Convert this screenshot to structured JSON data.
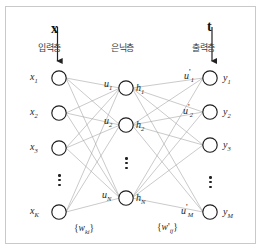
{
  "diagram": {
    "background_color": "#ffffff",
    "border_color": "#c9c9c9",
    "node_stroke_color": "#1e1e1e",
    "edge_color": "#9a9a9a",
    "arrow_color": "#222222"
  },
  "vectors": {
    "input_vector": "x",
    "target_vector": "t"
  },
  "layers": {
    "input_name": "입력층",
    "hidden_name": "은닉층",
    "output_name": "출력층"
  },
  "input_nodes": [
    {
      "label": "x",
      "sub": "1"
    },
    {
      "label": "x",
      "sub": "2"
    },
    {
      "label": "x",
      "sub": "3"
    },
    {
      "label": "x",
      "sub": "K"
    }
  ],
  "hidden_nodes": [
    {
      "pre_label": "u",
      "pre_sub": "1",
      "act_label": "h",
      "act_sub": "1"
    },
    {
      "pre_label": "u",
      "pre_sub": "2",
      "act_label": "h",
      "act_sub": "2"
    },
    {
      "pre_label": "u",
      "pre_sub": "N",
      "act_label": "h",
      "act_sub": "N"
    }
  ],
  "output_nodes": [
    {
      "pre_label": "u",
      "pre_prime": "'",
      "pre_sub": "1",
      "out_label": "y",
      "out_sub": "1"
    },
    {
      "pre_label": "u",
      "pre_prime": "'",
      "pre_sub": "2",
      "out_label": "y",
      "out_sub": "2"
    },
    {
      "pre_label": "",
      "pre_prime": "",
      "pre_sub": "",
      "out_label": "y",
      "out_sub": "3"
    },
    {
      "pre_label": "u",
      "pre_prime": "'",
      "pre_sub": "M",
      "out_label": "y",
      "out_sub": "M"
    }
  ],
  "weights": {
    "input_to_hidden": {
      "open": "{",
      "symbol": "w",
      "prime": "",
      "sub": "ki",
      "close": "}"
    },
    "hidden_to_output": {
      "open": "{",
      "symbol": "w",
      "prime": "'",
      "sub": "ij",
      "close": "}"
    }
  },
  "ellipsis": {
    "input_dots": "⋮",
    "hidden_dots": "⋮",
    "output_dots": "⋮"
  }
}
